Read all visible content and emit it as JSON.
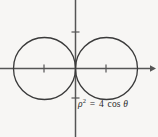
{
  "figure": {
    "caption_equation": {
      "rho_symbol": "ρ",
      "exponent": "2",
      "equals": "=",
      "coefficient": "4",
      "function": "cos",
      "theta_symbol": "θ",
      "full_text": "ρ² = 4 cos θ"
    },
    "background_color": "#f7f6f4",
    "stroke_color": "#3a3a3a",
    "axis_color": "#555555",
    "text_color": "#2a2a2a"
  },
  "chart_data": {
    "type": "line",
    "title": "",
    "subtitle": "",
    "xlabel": "",
    "ylabel": "",
    "annotations": [
      {
        "text": "ρ² = 4 cos θ",
        "x_px": 78,
        "y_px": 100,
        "role": "equation-label"
      }
    ],
    "coordinate_system": "cartesian-with-polar-curve",
    "grid": false,
    "legend": null,
    "axes": {
      "x_axis": {
        "visible": true,
        "y_px": 68.5,
        "x_start_px": 0,
        "x_end_px": 152,
        "arrow": "right",
        "ticks_px": [
          44,
          106
        ],
        "tick_labels": [
          "",
          ""
        ],
        "tick_half_length_px": 4
      },
      "y_axis": {
        "visible": true,
        "x_px": 75.5,
        "y_start_px": 0,
        "y_end_px": 137,
        "arrow": "none",
        "ticks_px": [
          32,
          98
        ],
        "tick_labels": [
          "",
          ""
        ],
        "tick_half_length_px": 4
      }
    },
    "series": [
      {
        "name": "left-circle",
        "shape": "circle",
        "center_px": [
          44.5,
          68.5
        ],
        "radius_px": 31,
        "polar_equation": "ρ² = 4 cos θ (left lobe)",
        "stroke": "#3a3a3a",
        "stroke_width": 1.3,
        "fill": "none"
      },
      {
        "name": "right-circle",
        "shape": "circle",
        "center_px": [
          106.5,
          68.5
        ],
        "radius_px": 31,
        "polar_equation": "ρ² = 4 cos θ (right lobe)",
        "stroke": "#3a3a3a",
        "stroke_width": 1.3,
        "fill": "none"
      }
    ],
    "xlim": [
      -2.44,
      2.44
    ],
    "ylim": [
      -2.2,
      2.2
    ]
  }
}
